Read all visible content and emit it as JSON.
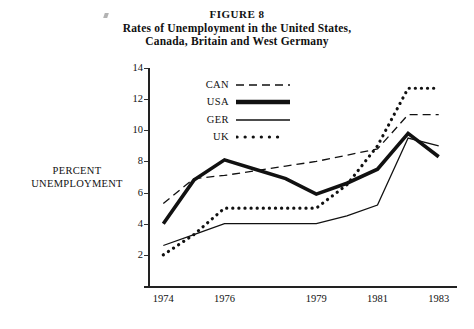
{
  "figure": {
    "number_label": "FIGURE 8",
    "title_line_1": "Rates of Unemployment in the United States,",
    "title_line_2": "Canada, Britain and West Germany"
  },
  "axis": {
    "y_label_line_1": "PERCENT",
    "y_label_line_2": "UNEMPLOYMENT",
    "y_ticks": [
      "2",
      "4",
      "6",
      "8",
      "10",
      "12",
      "14"
    ],
    "x_ticks": [
      "1974",
      "1976",
      "1979",
      "1981",
      "1983"
    ]
  },
  "legend": [
    {
      "label": "CAN",
      "style": "dashed",
      "color": "#111111"
    },
    {
      "label": "USA",
      "style": "thick-solid",
      "color": "#111111"
    },
    {
      "label": "GER",
      "style": "thin-solid",
      "color": "#111111"
    },
    {
      "label": "UK",
      "style": "dotted",
      "color": "#111111"
    }
  ],
  "chart_data": {
    "type": "line",
    "title": "Rates of Unemployment in the United States, Canada, Britain and West Germany",
    "subtitle": "FIGURE 8",
    "xlabel": "",
    "ylabel": "PERCENT UNEMPLOYMENT",
    "xlim": [
      1973.5,
      1983.5
    ],
    "ylim": [
      0,
      14
    ],
    "xticks": [
      1974,
      1976,
      1979,
      1981,
      1983
    ],
    "yticks": [
      2,
      4,
      6,
      8,
      10,
      12,
      14
    ],
    "grid": false,
    "legend_position": "upper-left-inside",
    "x": [
      1974,
      1975,
      1976,
      1977,
      1978,
      1979,
      1980,
      1981,
      1982,
      1983
    ],
    "series": [
      {
        "name": "CAN",
        "style": "dashed",
        "values": [
          5.3,
          6.9,
          7.1,
          7.4,
          7.7,
          8.0,
          8.4,
          8.8,
          11.0,
          11.0
        ]
      },
      {
        "name": "USA",
        "style": "thick-solid",
        "values": [
          4.0,
          6.8,
          8.1,
          7.5,
          6.9,
          5.9,
          6.6,
          7.5,
          9.8,
          8.3
        ]
      },
      {
        "name": "GER",
        "style": "thin-solid",
        "values": [
          2.6,
          3.3,
          4.0,
          4.0,
          4.0,
          4.0,
          4.5,
          5.2,
          9.5,
          9.0
        ]
      },
      {
        "name": "UK",
        "style": "dotted",
        "values": [
          2.0,
          3.3,
          5.0,
          5.0,
          5.0,
          5.0,
          6.5,
          9.0,
          12.7,
          12.7
        ]
      }
    ]
  }
}
